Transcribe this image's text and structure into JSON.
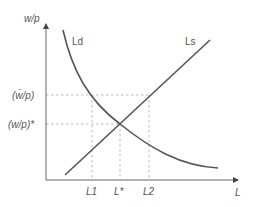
{
  "diagram": {
    "colors": {
      "curve": "#555555",
      "axis": "#666666",
      "guide": "#aaaaaa",
      "text": "#555555"
    },
    "axes": {
      "y_label": "w/p",
      "x_label": "L"
    },
    "curves": {
      "demand_label": "Ld",
      "supply_label": "Ls"
    },
    "y_ticks": {
      "rigid_wage": "(w̄/p)",
      "equilibrium_wage": "(w/p)*"
    },
    "x_ticks": {
      "l1": "L1",
      "lstar": "L*",
      "l2": "L2"
    }
  }
}
